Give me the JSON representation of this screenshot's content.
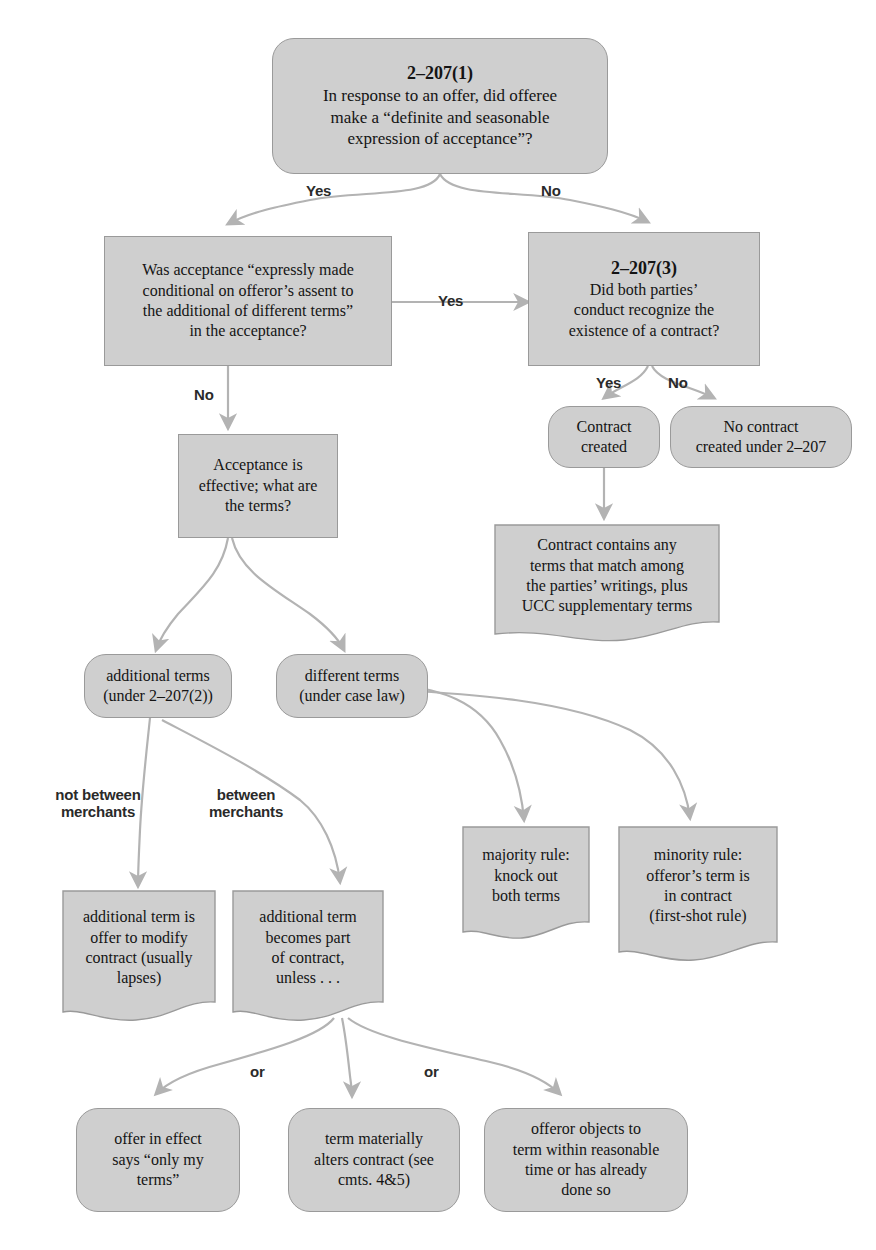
{
  "diagram": {
    "accent_fill": "#cfcfcf",
    "accent_stroke": "#9a9a9a",
    "arrow_color": "#b3b3b3",
    "text_color": "#141414"
  },
  "nodes": {
    "q1": {
      "header": "2–207(1)",
      "text": "In response to an offer, did offeree\nmake a “definite and seasonable\nexpression of acceptance”?"
    },
    "q2": {
      "text": "Was acceptance “expressly made\nconditional on offeror’s assent to\nthe additional of different terms”\nin the acceptance?"
    },
    "q3": {
      "header": "2–207(3)",
      "text": "Did both parties’\nconduct recognize the\nexistence of a contract?"
    },
    "contract_created": {
      "text": "Contract\ncreated"
    },
    "no_contract": {
      "text": "No contract\ncreated under 2–207"
    },
    "contract_contains": {
      "text": "Contract contains any\nterms that match among\nthe parties’ writings, plus\nUCC supplementary terms"
    },
    "acceptance_effective": {
      "text": "Acceptance is\neffective; what are\nthe terms?"
    },
    "additional_terms": {
      "text": "additional terms\n(under 2–207(2))"
    },
    "different_terms": {
      "text": "different terms\n(under case law)"
    },
    "majority_rule": {
      "text": "majority rule:\nknock out\nboth terms"
    },
    "minority_rule": {
      "text": "minority rule:\nofferor’s term is\nin contract\n(first-shot rule)"
    },
    "offer_to_modify": {
      "text": "additional term is\noffer to modify\ncontract (usually\nlapses)"
    },
    "becomes_part": {
      "text": "additional term\nbecomes part\nof contract,\nunless . . ."
    },
    "only_my_terms": {
      "text": "offer in effect\nsays “only my\nterms”"
    },
    "materially_alters": {
      "text": "term materially\nalters contract (see\ncmts. 4&5)"
    },
    "offeror_objects": {
      "text": "offeror objects to\nterm within reasonable\ntime or has already\ndone so"
    }
  },
  "edge_labels": {
    "q1_yes": "Yes",
    "q1_no": "No",
    "q2_yes": "Yes",
    "q2_no": "No",
    "q3_yes": "Yes",
    "q3_no": "No",
    "not_between_merchants": "not between\nmerchants",
    "between_merchants": "between\nmerchants",
    "or_left": "or",
    "or_right": "or"
  }
}
